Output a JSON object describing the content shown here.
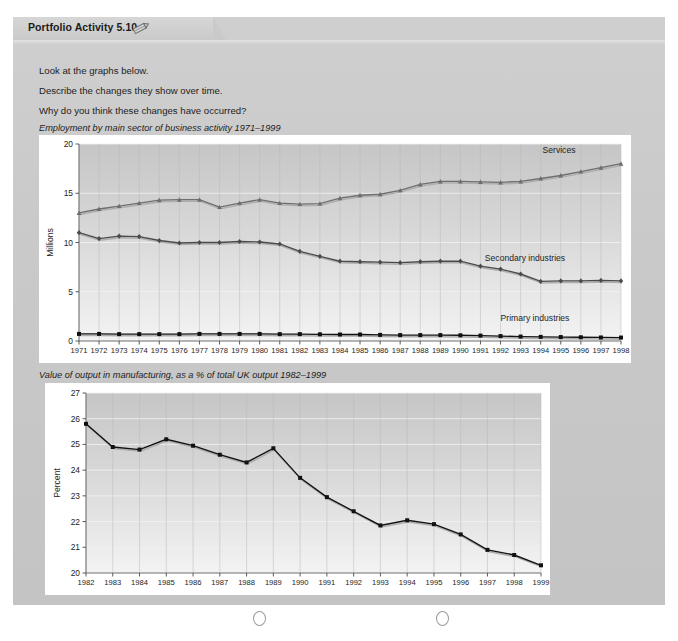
{
  "top_ghost_text": "· · · ·   · · · · · ·",
  "folder": {
    "tab_title": "Portfolio Activity 5.10",
    "pencil_icon": "pencil-icon"
  },
  "instructions": [
    "Look at the graphs below.",
    "Describe the changes they show over time.",
    "Why do you think these changes have occurred?"
  ],
  "binder_holes": {
    "left_label": "binder-hole-left",
    "right_label": "binder-hole-right"
  },
  "chart_data": [
    {
      "id": "employment",
      "type": "line",
      "title": "Employment by main sector of business activity 1971–1999",
      "xlabel": "",
      "ylabel": "Millions",
      "ylim": [
        0,
        20
      ],
      "yticks": [
        0,
        5,
        10,
        15,
        20
      ],
      "grid": true,
      "legend_position": "inline-right",
      "categories": [
        1971,
        1972,
        1973,
        1974,
        1975,
        1976,
        1977,
        1978,
        1979,
        1980,
        1981,
        1982,
        1983,
        1984,
        1985,
        1986,
        1987,
        1988,
        1989,
        1990,
        1991,
        1992,
        1993,
        1994,
        1995,
        1996,
        1997,
        1998
      ],
      "xticklabels": [
        "1971",
        "1972",
        "1973",
        "1974",
        "1975",
        "1976",
        "1977",
        "1978",
        "1979",
        "1980",
        "1981",
        "1982",
        "1983",
        "1984",
        "1985",
        "1986",
        "1987",
        "1988",
        "1989",
        "1990",
        "1991",
        "1992",
        "1993",
        "1994",
        "1995",
        "1996",
        "1997",
        "1998"
      ],
      "series": [
        {
          "name": "Services",
          "color": "#6e6e6e",
          "marker": "triangle",
          "values": [
            13.0,
            13.4,
            13.7,
            14.0,
            14.3,
            14.35,
            14.35,
            13.6,
            14.0,
            14.35,
            14.0,
            13.9,
            13.95,
            14.5,
            14.8,
            14.9,
            15.3,
            15.9,
            16.2,
            16.2,
            16.15,
            16.1,
            16.2,
            16.5,
            16.8,
            17.2,
            17.6,
            18.0
          ]
        },
        {
          "name": "Secondary industries",
          "color": "#4a4a4a",
          "marker": "diamond",
          "values": [
            11.0,
            10.4,
            10.65,
            10.6,
            10.2,
            9.95,
            10.0,
            10.0,
            10.1,
            10.05,
            9.85,
            9.1,
            8.6,
            8.1,
            8.05,
            8.0,
            7.95,
            8.05,
            8.1,
            8.1,
            7.6,
            7.3,
            6.8,
            6.05,
            6.1,
            6.1,
            6.15,
            6.1
          ]
        },
        {
          "name": "Primary industries",
          "color": "#111111",
          "marker": "square",
          "values": [
            0.72,
            0.72,
            0.7,
            0.7,
            0.7,
            0.7,
            0.72,
            0.72,
            0.72,
            0.72,
            0.7,
            0.7,
            0.68,
            0.66,
            0.66,
            0.62,
            0.6,
            0.6,
            0.6,
            0.58,
            0.55,
            0.5,
            0.45,
            0.42,
            0.4,
            0.38,
            0.36,
            0.35
          ]
        }
      ]
    },
    {
      "id": "manufacturing-output",
      "type": "line",
      "title": "Value of output in manufacturing, as a % of total UK output 1982–1999",
      "xlabel": "",
      "ylabel": "Percent",
      "ylim": [
        20,
        27
      ],
      "yticks": [
        20,
        21,
        22,
        23,
        24,
        25,
        26,
        27
      ],
      "grid": true,
      "legend_position": "none",
      "categories": [
        1982,
        1983,
        1984,
        1985,
        1986,
        1987,
        1988,
        1989,
        1990,
        1991,
        1992,
        1993,
        1994,
        1995,
        1996,
        1997,
        1998,
        1999
      ],
      "xticklabels": [
        "1982",
        "1983",
        "1984",
        "1985",
        "1986",
        "1987",
        "1988",
        "1989",
        "1990",
        "1991",
        "1992",
        "1993",
        "1994",
        "1995",
        "1996",
        "1997",
        "1998",
        "1999"
      ],
      "series": [
        {
          "name": "Manufacturing output",
          "color": "#111111",
          "marker": "square",
          "values": [
            25.8,
            24.9,
            24.8,
            25.2,
            24.95,
            24.6,
            24.3,
            24.85,
            23.7,
            22.95,
            22.4,
            21.85,
            22.05,
            21.9,
            21.5,
            20.9,
            20.7,
            20.3
          ]
        }
      ]
    }
  ]
}
